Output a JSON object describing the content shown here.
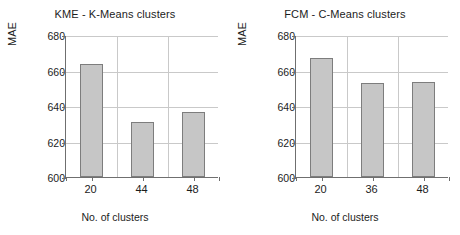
{
  "figure": {
    "background": "#ffffff",
    "bar_fill": "#c6c6c6",
    "bar_stroke": "#7d7d7d",
    "grid_color": "#c9c9c9",
    "axis_color": "#6f6f6f"
  },
  "chart_data": [
    {
      "type": "bar",
      "title": "KME - K-Means clusters",
      "xlabel": "No. of clusters",
      "ylabel": "MAE",
      "categories": [
        "20",
        "44",
        "48"
      ],
      "values": [
        663.5,
        630.8,
        636.8
      ],
      "ylim": [
        600,
        680
      ],
      "yticks": [
        600,
        620,
        640,
        660,
        680
      ],
      "ytick_labels": [
        "600",
        "620",
        "640",
        "660",
        "680"
      ],
      "grid": "horizontal-and-vertical",
      "legend": "none"
    },
    {
      "type": "bar",
      "title": "FCM - C-Means clusters",
      "xlabel": "No. of clusters",
      "ylabel": "MAE",
      "categories": [
        "20",
        "36",
        "48"
      ],
      "values": [
        667.0,
        652.8,
        653.5
      ],
      "ylim": [
        600,
        680
      ],
      "yticks": [
        600,
        620,
        640,
        660,
        680
      ],
      "ytick_labels": [
        "600",
        "620",
        "640",
        "660",
        "680"
      ],
      "grid": "horizontal-and-vertical",
      "legend": "none"
    }
  ]
}
